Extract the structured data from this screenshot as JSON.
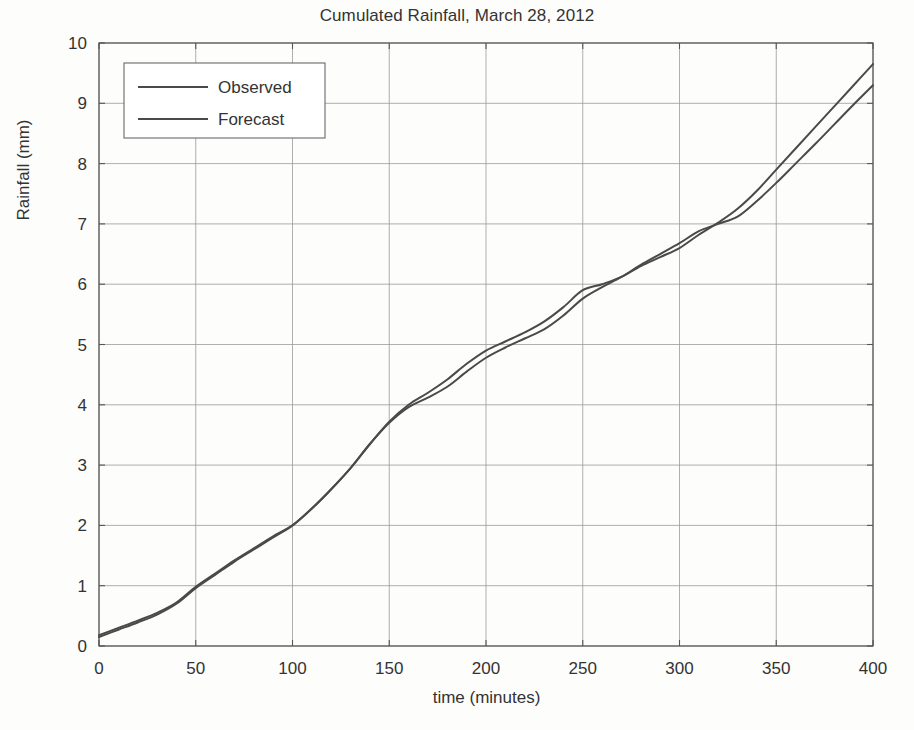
{
  "chart_data": {
    "type": "line",
    "title": "Cumulated Rainfall, March 28, 2012",
    "xlabel": "time (minutes)",
    "ylabel": "Rainfall (mm)",
    "xlim": [
      0,
      400
    ],
    "ylim": [
      0,
      10
    ],
    "xticks": [
      0,
      50,
      100,
      150,
      200,
      250,
      300,
      350,
      400
    ],
    "yticks": [
      0,
      1,
      2,
      3,
      4,
      5,
      6,
      7,
      8,
      9,
      10
    ],
    "xtick_labels": [
      "0",
      "50",
      "100",
      "150",
      "200",
      "250",
      "300",
      "350",
      "400"
    ],
    "ytick_labels": [
      "0",
      "1",
      "2",
      "3",
      "4",
      "5",
      "6",
      "7",
      "8",
      "9",
      "10"
    ],
    "grid": true,
    "legend_position": "upper left",
    "line_color": "#4a4a4a",
    "grid_color": "#9a9a9a",
    "axis_color": "#555555",
    "background_color": "#fdfdfc",
    "x": [
      0,
      10,
      20,
      30,
      40,
      50,
      60,
      70,
      80,
      90,
      100,
      110,
      120,
      130,
      140,
      150,
      160,
      170,
      180,
      190,
      200,
      210,
      220,
      230,
      240,
      250,
      260,
      270,
      280,
      290,
      300,
      310,
      320,
      330,
      340,
      350,
      360,
      370,
      380,
      390,
      400
    ],
    "series": [
      {
        "name": "Observed",
        "values": [
          0.18,
          0.3,
          0.42,
          0.55,
          0.72,
          0.98,
          1.2,
          1.42,
          1.62,
          1.82,
          2.0,
          2.28,
          2.6,
          2.95,
          3.35,
          3.72,
          4.0,
          4.2,
          4.42,
          4.68,
          4.9,
          5.05,
          5.2,
          5.38,
          5.62,
          5.9,
          6.0,
          6.12,
          6.3,
          6.45,
          6.6,
          6.82,
          7.02,
          7.25,
          7.55,
          7.9,
          8.25,
          8.6,
          8.95,
          9.3,
          9.65
        ]
      },
      {
        "name": "Forecast",
        "values": [
          0.15,
          0.27,
          0.39,
          0.52,
          0.7,
          0.96,
          1.18,
          1.4,
          1.6,
          1.8,
          2.0,
          2.28,
          2.6,
          2.95,
          3.35,
          3.7,
          3.96,
          4.12,
          4.3,
          4.55,
          4.78,
          4.95,
          5.1,
          5.25,
          5.48,
          5.76,
          5.95,
          6.12,
          6.32,
          6.5,
          6.68,
          6.88,
          7.0,
          7.12,
          7.38,
          7.68,
          8.0,
          8.32,
          8.65,
          8.98,
          9.3
        ]
      }
    ]
  },
  "legend": {
    "items": [
      {
        "label": "Observed"
      },
      {
        "label": "Forecast"
      }
    ]
  }
}
